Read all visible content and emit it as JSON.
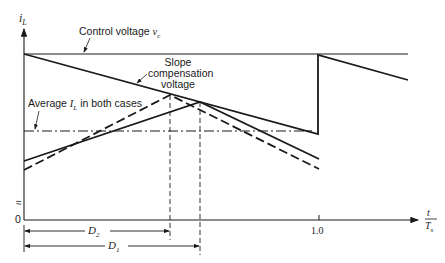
{
  "diagram": {
    "y_axis_label": "i",
    "y_axis_sub": "L",
    "x_axis_label_num": "t",
    "x_axis_label_den": "T",
    "x_axis_label_den_sub": "s",
    "origin_label": "0",
    "x_tick_label": "1.0",
    "control_voltage_label": "Control voltage ",
    "control_voltage_symbol": "v",
    "control_voltage_sub": "c",
    "slope_comp_line1": "Slope",
    "slope_comp_line2": "compensation",
    "slope_comp_line3": "voltage",
    "average_label_pre": "Average ",
    "average_symbol": "I",
    "average_sub": "L",
    "average_label_post": " in both cases",
    "d2_label": "D",
    "d2_sub": "2",
    "d1_label": "D",
    "d1_sub": "1",
    "axis_break_symbol": "≈"
  }
}
